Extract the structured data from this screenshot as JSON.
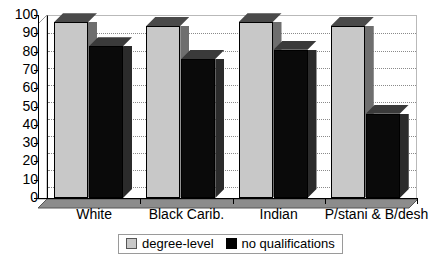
{
  "chart_data": {
    "type": "bar",
    "title": "",
    "subtitle": "",
    "xlabel": "",
    "ylabel": "",
    "categories": [
      "White",
      "Black Carib.",
      "Indian",
      "P/stani & B/deshi"
    ],
    "series": [
      {
        "name": "degree-level",
        "color": "#c8c8c8",
        "values": [
          96,
          94,
          96,
          94
        ]
      },
      {
        "name": "no qualifications",
        "color": "#000000",
        "values": [
          83,
          76,
          81,
          46
        ]
      }
    ],
    "ylim": [
      0,
      100
    ],
    "yticks": [
      0,
      10,
      20,
      30,
      40,
      50,
      60,
      70,
      80,
      90,
      100
    ],
    "ytick_labels": [
      "0",
      "10",
      "20",
      "30",
      "40",
      "50",
      "60",
      "70",
      "80",
      "90",
      "100"
    ],
    "grid": true,
    "grid_style": "dotted-horizontal",
    "legend_position": "bottom-center",
    "style": "3d-column",
    "annotations": []
  },
  "legend": {
    "items": [
      {
        "label": "degree-level",
        "swatch": "light-gray-square"
      },
      {
        "label": "no qualifications",
        "swatch": "black-square"
      }
    ]
  }
}
